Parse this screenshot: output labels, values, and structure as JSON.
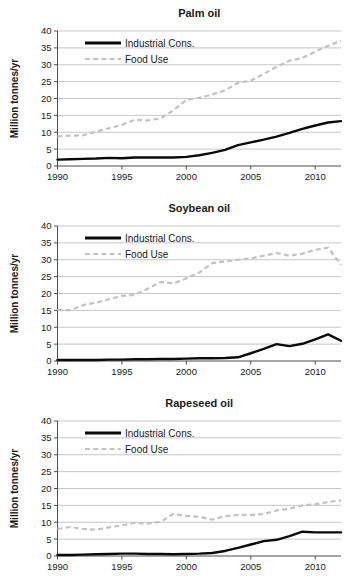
{
  "figure": {
    "background": "#ffffff",
    "panel_count": 3
  },
  "style": {
    "industrial_color": "#0a0a0a",
    "food_color": "#c2c2c2",
    "gridline_color": "#b9b9b9",
    "axis_color": "#4d4d4d",
    "text_color": "#1a1a1a"
  },
  "common": {
    "ylabel": "Million tonnes/yr",
    "xlabel": "",
    "ytick_labels": [
      "0",
      "5",
      "10",
      "15",
      "20",
      "25",
      "30",
      "35",
      "40"
    ],
    "xtick_labels": [
      "1990",
      "1995",
      "2000",
      "2005",
      "2010"
    ],
    "legend": {
      "industrial_label": "Industrial Cons.",
      "food_label": "Food Use"
    }
  },
  "chart_data": [
    {
      "type": "line",
      "title": "Palm oil",
      "xlabel": "",
      "ylabel": "Million tonnes/yr",
      "xlim": [
        1990,
        2012
      ],
      "ylim": [
        0,
        40
      ],
      "yticks": [
        0,
        5,
        10,
        15,
        20,
        25,
        30,
        35,
        40
      ],
      "xticks": [
        1990,
        1995,
        2000,
        2005,
        2010
      ],
      "grid": true,
      "legend_position": "upper-left",
      "x": [
        1990,
        1991,
        1992,
        1993,
        1994,
        1995,
        1996,
        1997,
        1998,
        1999,
        2000,
        2001,
        2002,
        2003,
        2004,
        2005,
        2006,
        2007,
        2008,
        2009,
        2010,
        2011,
        2012
      ],
      "series": [
        {
          "name": "Industrial Cons.",
          "style": "solid",
          "color": "#0a0a0a",
          "values": [
            1.9,
            2.0,
            2.1,
            2.2,
            2.4,
            2.3,
            2.5,
            2.5,
            2.5,
            2.5,
            2.7,
            3.2,
            3.9,
            4.8,
            6.2,
            7.0,
            7.8,
            8.7,
            9.8,
            11.0,
            12.0,
            12.9,
            13.3
          ]
        },
        {
          "name": "Food Use",
          "style": "dashed",
          "color": "#c2c2c2",
          "values": [
            8.8,
            9.0,
            9.1,
            10.2,
            11.2,
            12.2,
            13.7,
            13.5,
            14.1,
            16.5,
            19.6,
            20.2,
            21.2,
            22.4,
            24.6,
            25.3,
            27.3,
            29.4,
            31.2,
            32.0,
            33.9,
            35.6,
            37.1
          ]
        }
      ]
    },
    {
      "type": "line",
      "title": "Soybean oil",
      "xlabel": "",
      "ylabel": "Million tonnes/yr",
      "xlim": [
        1990,
        2012
      ],
      "ylim": [
        0,
        40
      ],
      "yticks": [
        0,
        5,
        10,
        15,
        20,
        25,
        30,
        35,
        40
      ],
      "xticks": [
        1990,
        1995,
        2000,
        2005,
        2010
      ],
      "grid": true,
      "legend_position": "upper-left",
      "x": [
        1990,
        1991,
        1992,
        1993,
        1994,
        1995,
        1996,
        1997,
        1998,
        1999,
        2000,
        2001,
        2002,
        2003,
        2004,
        2005,
        2006,
        2007,
        2008,
        2009,
        2010,
        2011,
        2012
      ],
      "series": [
        {
          "name": "Industrial Cons.",
          "style": "solid",
          "color": "#0a0a0a",
          "values": [
            0.3,
            0.3,
            0.3,
            0.3,
            0.4,
            0.4,
            0.5,
            0.5,
            0.6,
            0.6,
            0.7,
            0.8,
            0.8,
            0.9,
            1.1,
            2.3,
            3.6,
            5.0,
            4.4,
            5.1,
            6.4,
            7.9,
            6.0
          ]
        },
        {
          "name": "Food Use",
          "style": "dashed",
          "color": "#c2c2c2",
          "values": [
            15.1,
            15.1,
            16.6,
            17.3,
            18.3,
            19.3,
            19.6,
            21.4,
            23.4,
            23.0,
            24.5,
            26.2,
            29.0,
            29.5,
            30.0,
            30.4,
            31.2,
            32.0,
            31.2,
            31.8,
            32.9,
            33.6,
            28.5
          ]
        }
      ]
    },
    {
      "type": "line",
      "title": "Rapeseed oil",
      "xlabel": "",
      "ylabel": "Million tonnes/yr",
      "xlim": [
        1990,
        2012
      ],
      "ylim": [
        0,
        40
      ],
      "yticks": [
        0,
        5,
        10,
        15,
        20,
        25,
        30,
        35,
        40
      ],
      "xticks": [
        1990,
        1995,
        2000,
        2005,
        2010
      ],
      "grid": true,
      "legend_position": "upper-left",
      "x": [
        1990,
        1991,
        1992,
        1993,
        1994,
        1995,
        1996,
        1997,
        1998,
        1999,
        2000,
        2001,
        2002,
        2003,
        2004,
        2005,
        2006,
        2007,
        2008,
        2009,
        2010,
        2011,
        2012
      ],
      "series": [
        {
          "name": "Industrial Cons.",
          "style": "solid",
          "color": "#0a0a0a",
          "values": [
            0.3,
            0.3,
            0.4,
            0.5,
            0.6,
            0.7,
            0.7,
            0.6,
            0.6,
            0.5,
            0.6,
            0.7,
            0.9,
            1.5,
            2.4,
            3.4,
            4.4,
            4.8,
            5.9,
            7.2,
            7.0,
            7.0,
            7.0
          ]
        },
        {
          "name": "Food Use",
          "style": "dashed",
          "color": "#c2c2c2",
          "values": [
            8.0,
            8.6,
            8.0,
            7.8,
            8.5,
            9.1,
            9.8,
            9.6,
            10.1,
            12.5,
            11.9,
            11.6,
            10.8,
            11.8,
            12.2,
            12.2,
            12.4,
            13.5,
            14.0,
            15.0,
            15.3,
            16.0,
            16.5
          ]
        }
      ]
    }
  ]
}
